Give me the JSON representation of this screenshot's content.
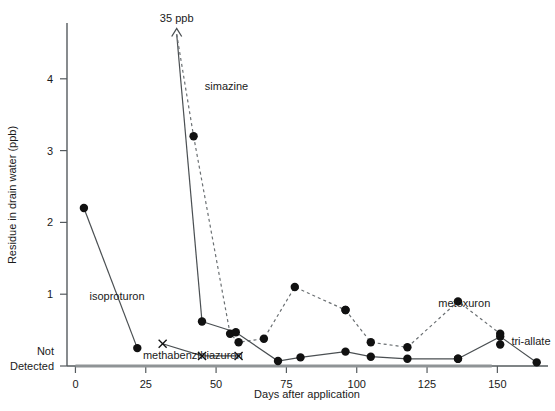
{
  "chart_data": {
    "type": "line",
    "title": "",
    "xlabel": "Days after application",
    "ylabel": "Residue in drain water (ppb)",
    "xlim": [
      -3,
      168
    ],
    "ylim": [
      0,
      4.6
    ],
    "grid": false,
    "legend": "inline-annotations",
    "x_ticks": [
      0,
      25,
      50,
      75,
      100,
      125,
      150
    ],
    "x_tick_labels": [
      "0",
      "25",
      "50",
      "75",
      "100",
      "125",
      "150"
    ],
    "y_ticks": [
      0,
      1,
      2,
      3,
      4
    ],
    "y_tick_labels": [
      "Not\nDetected",
      "1",
      "2",
      "3",
      "4"
    ],
    "y_zero_label_line1": "Not",
    "y_zero_label_line2": "Detected",
    "annotations": [
      {
        "name": "off-scale-arrow",
        "text": "35 ppb",
        "x": 36,
        "y": 4.7,
        "note": "dashed arrow pointing off top of axis for simazine peak"
      }
    ],
    "series": [
      {
        "name": "isoproturon",
        "label": "isoproturon",
        "style": "solid",
        "marker": "filled-circle",
        "label_x": 5,
        "label_y": 0.92,
        "points": [
          [
            3,
            2.2
          ],
          [
            22,
            0.25
          ]
        ]
      },
      {
        "name": "simazine",
        "label": "simazine",
        "style": "dashed",
        "marker": "filled-circle",
        "label_x": 46,
        "label_y": 3.85,
        "points": [
          [
            42,
            3.2
          ],
          [
            55,
            0.45
          ],
          [
            58,
            0.33
          ],
          [
            67,
            0.38
          ],
          [
            78,
            1.1
          ],
          [
            96,
            0.78
          ]
        ]
      },
      {
        "name": "methabenzthiazuron",
        "label": "methabenzthiazuron",
        "style": "solid",
        "marker": "x",
        "label_x": 24,
        "label_y": 0.1,
        "points": [
          [
            31,
            0.31
          ],
          [
            45,
            0.14
          ],
          [
            58,
            0.14
          ]
        ]
      },
      {
        "name": "simazine-decline",
        "label": "",
        "style": "solid",
        "marker": "filled-circle",
        "label_x": 0,
        "label_y": 0,
        "points": [
          [
            45,
            0.62
          ],
          [
            57,
            0.47
          ],
          [
            72,
            0.07
          ],
          [
            80,
            0.12
          ],
          [
            96,
            0.2
          ],
          [
            105,
            0.13
          ],
          [
            118,
            0.1
          ],
          [
            136,
            0.1
          ]
        ]
      },
      {
        "name": "metoxuron",
        "label": "metoxuron",
        "style": "dashed",
        "marker": "filled-circle",
        "label_x": 129,
        "label_y": 0.82,
        "points": [
          [
            96,
            0.78
          ],
          [
            105,
            0.33
          ],
          [
            118,
            0.26
          ],
          [
            136,
            0.9
          ],
          [
            151,
            0.45
          ]
        ]
      },
      {
        "name": "tri-allate",
        "label": "tri-allate",
        "style": "solid",
        "marker": "filled-circle",
        "label_x": 155,
        "label_y": 0.3,
        "points": [
          [
            136,
            0.1
          ],
          [
            151,
            0.41
          ],
          [
            164,
            0.05
          ]
        ]
      },
      {
        "name": "tri-allate-extra-point",
        "label": "",
        "style": "none",
        "marker": "filled-circle",
        "label_x": 0,
        "label_y": 0,
        "points": [
          [
            151,
            0.3
          ]
        ]
      },
      {
        "name": "simazine-offscale-stem",
        "label": "",
        "style": "solid",
        "marker": "none",
        "label_x": 0,
        "label_y": 0,
        "points": [
          [
            36,
            4.62
          ],
          [
            45,
            0.62
          ]
        ]
      },
      {
        "name": "simazine-offscale-dashed",
        "label": "",
        "style": "dashed-arrow",
        "marker": "none",
        "label_x": 0,
        "label_y": 0,
        "points": [
          [
            36,
            4.62
          ],
          [
            42,
            3.2
          ]
        ]
      },
      {
        "name": "baseline-shadow",
        "label": "",
        "style": "thick-flat",
        "marker": "none",
        "label_x": 0,
        "label_y": 0,
        "points": [
          [
            0,
            0
          ],
          [
            148,
            0
          ]
        ]
      }
    ]
  }
}
